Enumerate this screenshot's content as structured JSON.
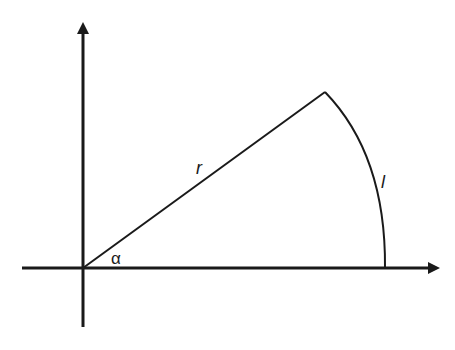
{
  "diagram": {
    "type": "circular-sector",
    "colors": {
      "stroke": "#1a1a1a",
      "background": "#ffffff"
    },
    "labels": {
      "radius": "r",
      "arc_length": "l",
      "angle": "α"
    },
    "axes": {
      "x_axis": "horizontal-arrow",
      "y_axis": "vertical-arrow"
    }
  }
}
